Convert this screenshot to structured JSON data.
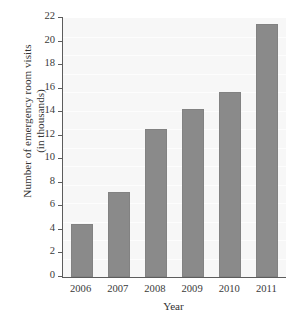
{
  "chart_data": {
    "type": "bar",
    "title": "",
    "xlabel": "Year",
    "ylabel": "Number of emergency room visits",
    "ylabel_line2": "(in thousands)",
    "categories": [
      "2006",
      "2007",
      "2008",
      "2009",
      "2010",
      "2011"
    ],
    "values": [
      4.5,
      7.2,
      12.6,
      14.3,
      15.7,
      21.5
    ],
    "series": [
      {
        "name": "Number of emergency room visits (in thousands)",
        "values": [
          4.5,
          7.2,
          12.6,
          14.3,
          15.7,
          21.5
        ]
      }
    ],
    "ylim": [
      0,
      22
    ],
    "yticks": [
      0,
      2,
      4,
      6,
      8,
      10,
      12,
      14,
      16,
      18,
      20,
      22
    ],
    "ytick_labels": [
      "0",
      "2",
      "4",
      "6",
      "8",
      "10",
      "12",
      "14",
      "16",
      "18",
      "20",
      "22"
    ],
    "xtick_labels": [
      "2006",
      "2007",
      "2008",
      "2009",
      "2010",
      "2011"
    ],
    "grid": false,
    "legend": null,
    "bar_color": "#8a8a8a",
    "axis_color": "#5c5c5c",
    "plot_background": "#f7f7f7"
  }
}
